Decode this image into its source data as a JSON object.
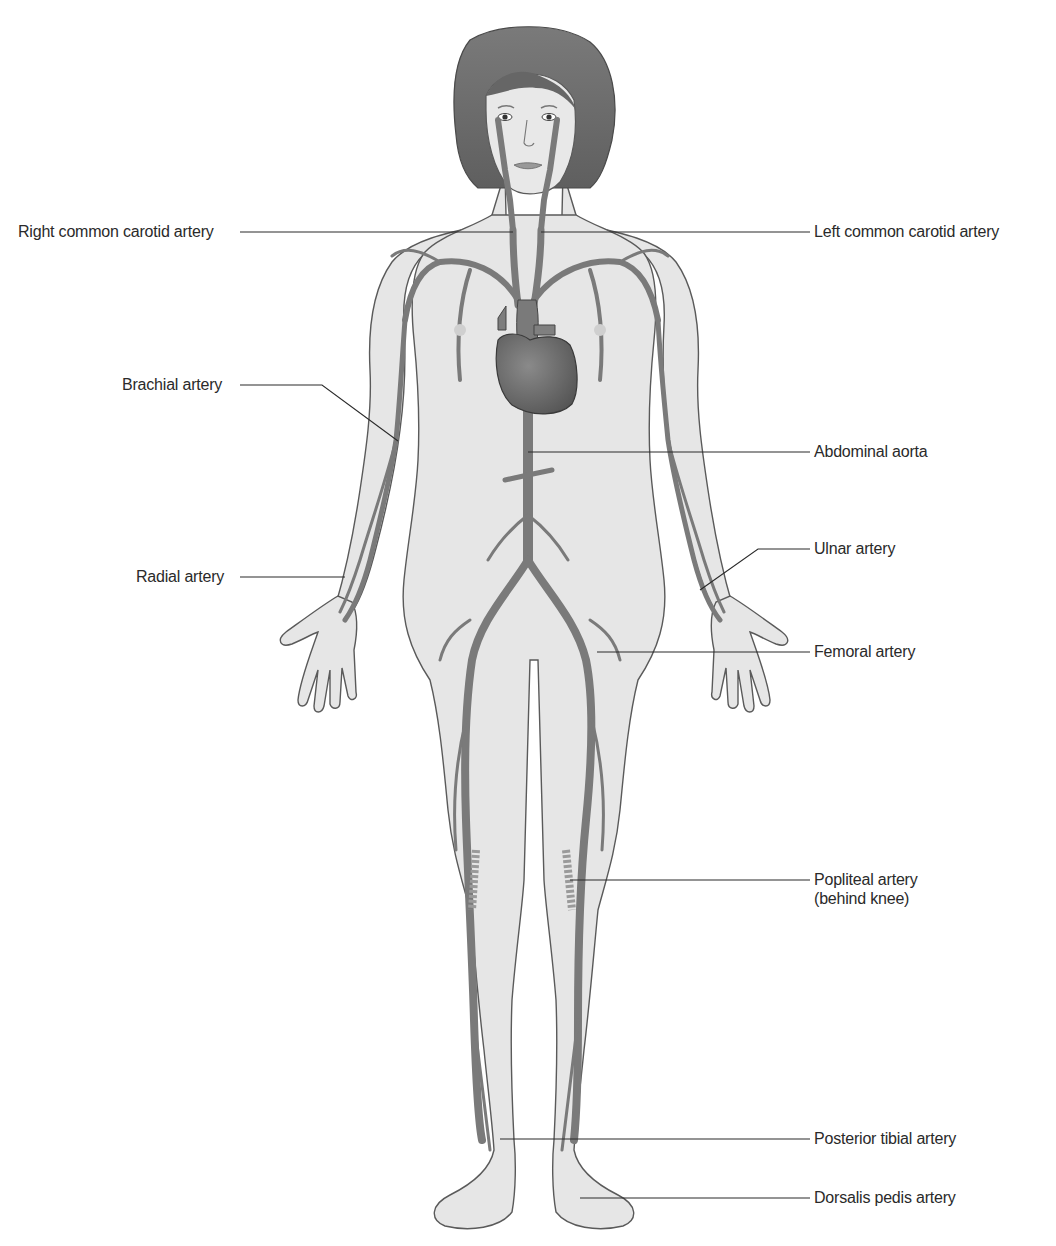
{
  "diagram": {
    "colors": {
      "background": "#ffffff",
      "skin": "#e6e6e6",
      "outline": "#5a5a5a",
      "artery": "#7a7a7a",
      "hair": "#6e6e6e",
      "heart": "#6a6a6a",
      "leader_line": "#2a2a2a",
      "text": "#2a2a2a"
    },
    "labels": {
      "right_common_carotid": "Right common carotid artery",
      "left_common_carotid": "Left common carotid artery",
      "brachial": "Brachial artery",
      "abdominal_aorta": "Abdominal aorta",
      "ulnar": "Ulnar artery",
      "radial": "Radial artery",
      "femoral": "Femoral artery",
      "popliteal_line1": "Popliteal artery",
      "popliteal_line2": "(behind knee)",
      "posterior_tibial": "Posterior tibial artery",
      "dorsalis_pedis": "Dorsalis pedis artery"
    }
  }
}
